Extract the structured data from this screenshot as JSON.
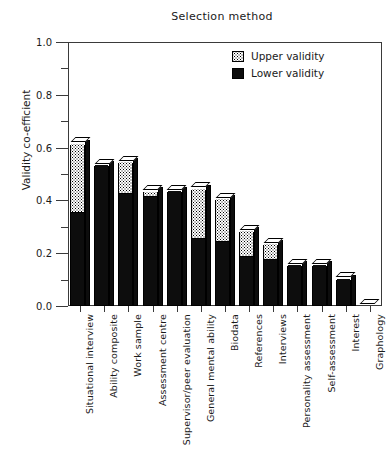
{
  "chart_data": {
    "type": "bar",
    "title": "Selection method",
    "xlabel": "",
    "ylabel": "Validity co-efficient",
    "ylim": [
      0.0,
      1.0
    ],
    "ytick_labels": [
      "0.0",
      "0.2",
      "0.4",
      "0.6",
      "0.8",
      "1.0"
    ],
    "ytick_values": [
      0.0,
      0.2,
      0.4,
      0.6,
      0.8,
      1.0
    ],
    "minor_ytick_values": [
      0.1,
      0.3,
      0.5,
      0.7,
      0.9
    ],
    "grid": false,
    "legend_position": "top-right",
    "stacked": true,
    "categories": [
      "Situational interview",
      "Ability composite",
      "Work sample",
      "Assessment centre",
      "Supervisor/peer evaluation",
      "General mental ability",
      "Biodata",
      "References",
      "Interviews",
      "Personality assessment",
      "Self-assessment",
      "Interest",
      "Graphology"
    ],
    "series": [
      {
        "name": "Lower validity",
        "color": "#0d0d0d",
        "values": [
          0.35,
          0.53,
          0.42,
          0.41,
          0.43,
          0.25,
          0.24,
          0.18,
          0.17,
          0.15,
          0.15,
          0.1,
          0.0
        ]
      },
      {
        "name": "Upper validity",
        "color": "#ffffff",
        "values": [
          0.61,
          0.53,
          0.54,
          0.43,
          0.43,
          0.44,
          0.4,
          0.28,
          0.23,
          0.15,
          0.15,
          0.1,
          0.0
        ]
      }
    ],
    "legend": [
      {
        "label": "Upper validity",
        "style": "dotted"
      },
      {
        "label": "Lower validity",
        "style": "solid-black"
      }
    ]
  }
}
